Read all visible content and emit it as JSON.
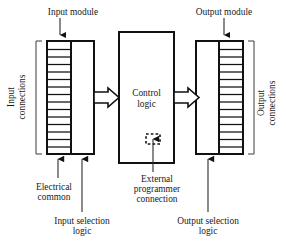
{
  "diagram": {
    "type": "block-diagram",
    "colors": {
      "stroke": "#111111",
      "text": "#1a1a1a",
      "background": "#ffffff",
      "bracket": "#3a3a3a",
      "leader": "#2b2b2b"
    },
    "labels": {
      "input_module": "Input module",
      "output_module": "Output module",
      "input_connections_line1": "Input",
      "input_connections_line2": "connections",
      "output_connections_line1": "Output",
      "output_connections_line2": "connections",
      "control_logic_line1": "Control",
      "control_logic_line2": "logic",
      "electrical_common_line1": "Electrical",
      "electrical_common_line2": "common",
      "external_prog_line1": "External",
      "external_prog_line2": "programmer",
      "external_prog_line3": "connection",
      "input_selection_line1": "Input selection",
      "input_selection_line2": "logic",
      "output_selection_line1": "Output selection",
      "output_selection_line2": "logic"
    },
    "blocks": [
      {
        "name": "input-module",
        "terminal_strip_rows": 14,
        "strip_side": "left"
      },
      {
        "name": "control-logic",
        "terminal_strip_rows": 0,
        "strip_side": "none"
      },
      {
        "name": "output-module",
        "terminal_strip_rows": 14,
        "strip_side": "right"
      }
    ],
    "connections": [
      {
        "from": "input-module",
        "to": "control-logic",
        "style": "hollow-block-arrow"
      },
      {
        "from": "control-logic",
        "to": "output-module",
        "style": "hollow-block-arrow"
      },
      {
        "from": "external-programmer",
        "to": "control-logic",
        "style": "dashed-port"
      }
    ]
  }
}
